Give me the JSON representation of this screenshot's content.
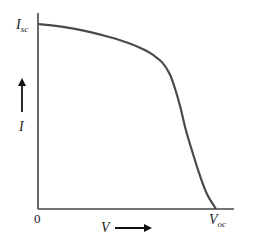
{
  "chart_data": {
    "type": "line",
    "title": "",
    "xlabel": "V",
    "ylabel": "I",
    "x_tick_labels": [
      "0",
      "V_oc"
    ],
    "y_tick_labels": [
      "I_sc"
    ],
    "origin_label": "0",
    "x_axis_end_label": {
      "main": "V",
      "sub": "oc"
    },
    "y_axis_top_label": {
      "main": "I",
      "sub": "sc"
    },
    "xlim": [
      0,
      1.0
    ],
    "ylim": [
      0,
      1.0
    ],
    "grid": false,
    "legend": "none",
    "series": [
      {
        "name": "I-V curve",
        "color": "#4a4a4a",
        "x": [
          0.0,
          0.1,
          0.2,
          0.3,
          0.4,
          0.5,
          0.6,
          0.65,
          0.7,
          0.74,
          0.77,
          0.8,
          0.83,
          0.87,
          0.91,
          0.95,
          1.0
        ],
        "y": [
          1.0,
          0.99,
          0.975,
          0.955,
          0.93,
          0.9,
          0.86,
          0.83,
          0.79,
          0.73,
          0.65,
          0.55,
          0.43,
          0.3,
          0.18,
          0.08,
          0.0
        ]
      }
    ]
  },
  "labels": {
    "isc_main": "I",
    "isc_sub": "sc",
    "voc_main": "V",
    "voc_sub": "oc",
    "zero": "0",
    "v_axis": "V",
    "i_axis": "I"
  }
}
